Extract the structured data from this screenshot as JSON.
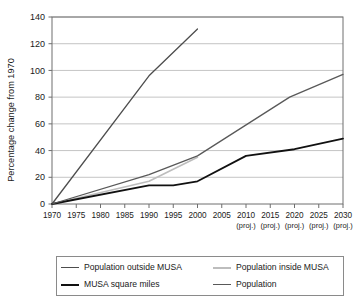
{
  "chart_data": {
    "type": "line",
    "title": "",
    "xlabel": "",
    "ylabel": "Percentage change from 1970",
    "xlim": [
      1970,
      2030
    ],
    "ylim": [
      0,
      140
    ],
    "ytick_step": 20,
    "grid": true,
    "legend_position": "bottom",
    "yticks": [
      0,
      20,
      40,
      60,
      80,
      100,
      120,
      140
    ],
    "ytick_labels": [
      "0",
      "20",
      "40",
      "60",
      "80",
      "100",
      "120",
      "140"
    ],
    "xticks": [
      1970,
      1975,
      1980,
      1985,
      1990,
      1995,
      2000,
      2005,
      2010,
      2015,
      2020,
      2025,
      2030
    ],
    "xtick_labels": [
      "1970",
      "1975",
      "1980",
      "1985",
      "1990",
      "1995",
      "2000",
      "2005",
      "2010",
      "2015",
      "2020",
      "2025",
      "2030"
    ],
    "xtick_sublabels": [
      "",
      "",
      "",
      "",
      "",
      "",
      "",
      "",
      "(proj.)",
      "(proj.)",
      "(proj.)",
      "(proj.)",
      "(proj.)"
    ],
    "projection_label": "(proj.)",
    "projection_start_year": 2010,
    "series": [
      {
        "name": "Population outside MUSA",
        "color": "#4d4d4d",
        "width": 1.3,
        "points": [
          [
            1970,
            0
          ],
          [
            1990,
            96
          ],
          [
            2000,
            131
          ]
        ]
      },
      {
        "name": "Population inside MUSA",
        "color": "#bdbdbd",
        "width": 1.6,
        "points": [
          [
            1970,
            0
          ],
          [
            1990,
            17
          ],
          [
            2000,
            35
          ]
        ]
      },
      {
        "name": "MUSA square miles",
        "color": "#111111",
        "width": 1.8,
        "points": [
          [
            1970,
            0
          ],
          [
            1990,
            14
          ],
          [
            1995,
            14
          ],
          [
            2000,
            17
          ],
          [
            2010,
            36
          ],
          [
            2020,
            41
          ],
          [
            2030,
            49
          ]
        ]
      },
      {
        "name": "Population",
        "color": "#595959",
        "width": 1.3,
        "points": [
          [
            1970,
            0
          ],
          [
            1990,
            22
          ],
          [
            2000,
            36
          ],
          [
            2019,
            80
          ],
          [
            2030,
            97
          ]
        ]
      }
    ]
  },
  "legend": {
    "entries": [
      {
        "label": "Population outside MUSA",
        "color": "#4d4d4d",
        "width": 1.6
      },
      {
        "label": "Population inside MUSA",
        "color": "#bdbdbd",
        "width": 2.0
      },
      {
        "label": "MUSA square miles",
        "color": "#111111",
        "width": 2.4
      },
      {
        "label": "Population",
        "color": "#595959",
        "width": 1.6
      }
    ]
  }
}
